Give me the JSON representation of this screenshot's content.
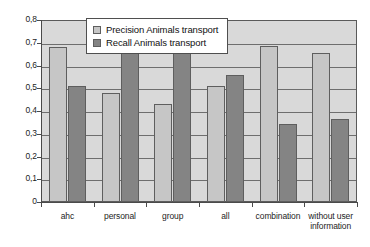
{
  "chart_data": {
    "type": "bar",
    "title": "",
    "subtitle": "",
    "xlabel": "",
    "ylabel": "",
    "ylim": [
      0,
      0.8
    ],
    "ytick_labels": [
      "0,8",
      "0,7",
      "0,6",
      "0,5",
      "0,4",
      "0,3",
      "0,2",
      "0,1",
      "0"
    ],
    "ytick_values": [
      0.8,
      0.7,
      0.6,
      0.5,
      0.4,
      0.3,
      0.2,
      0.1,
      0
    ],
    "grid": true,
    "legend_position": "top-center",
    "decimal_separator": ",",
    "categories": [
      "ahc",
      "personal",
      "group",
      "all",
      "combination",
      "without user information"
    ],
    "series": [
      {
        "name": "Precision Animals transport",
        "color": "#c6c6c6",
        "values": [
          0.68,
          0.48,
          0.43,
          0.51,
          0.685,
          0.655
        ]
      },
      {
        "name": "Recall Animals transport",
        "color": "#848484",
        "values": [
          0.51,
          0.685,
          0.675,
          0.56,
          0.345,
          0.365
        ]
      }
    ]
  },
  "legend": {
    "items": [
      {
        "label": "Precision Animals transport",
        "swatch": "precision"
      },
      {
        "label": "Recall Animals transport",
        "swatch": "recall"
      }
    ]
  },
  "colors": {
    "plot_background": "#d9d9d9",
    "precision_bar": "#c6c6c6",
    "recall_bar": "#848484",
    "axis": "#4a4a4a",
    "gridline": "#6e6e6e",
    "page_background": "#ffffff"
  }
}
